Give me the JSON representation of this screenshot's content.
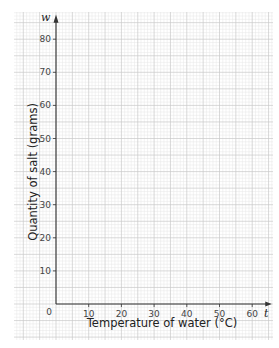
{
  "chart_data": {
    "type": "line",
    "title": "",
    "xlabel": "Temperature of water (°C)",
    "ylabel": "Quantity of salt (grams)",
    "x_var": "t",
    "y_var": "w",
    "xlim": [
      0,
      65
    ],
    "ylim": [
      0,
      85
    ],
    "x_ticks": [
      10,
      20,
      30,
      40,
      50,
      60
    ],
    "y_ticks": [
      10,
      20,
      30,
      40,
      50,
      60,
      70,
      80
    ],
    "origin_label": "0",
    "grid": true,
    "series": []
  }
}
